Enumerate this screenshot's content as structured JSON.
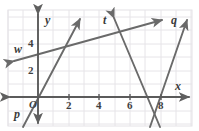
{
  "figure": {
    "kind": "coordinate-grid-line-diagram",
    "colors": {
      "background": "#ffffff",
      "grid": "#e2e0e4",
      "panel_border": "#e2e0e4",
      "axis": "#5b5b5b",
      "line": "#6a6a6a",
      "text": "#3a3a3a"
    }
  },
  "axes": {
    "x_label": "x",
    "y_label": "y",
    "origin_label": "O",
    "x_ticks": [
      "2",
      "4",
      "6",
      "8"
    ],
    "y_ticks": [
      "2",
      "4"
    ],
    "x_range": [
      -2,
      10
    ],
    "y_range": [
      -2,
      6
    ]
  },
  "lines": [
    {
      "name": "p",
      "label": "p",
      "description": "steep rising line through lower left, crossing x-axis just left of the origin"
    },
    {
      "name": "w",
      "label": "w",
      "description": "shallow rising line crossing the y-axis near y = 4"
    },
    {
      "name": "t",
      "label": "t",
      "description": "steeply falling line from upper middle down past x = 7 below the axis"
    },
    {
      "name": "q",
      "label": "q",
      "description": "steeply rising line from below the axis near x = 8 up to the right"
    }
  ]
}
